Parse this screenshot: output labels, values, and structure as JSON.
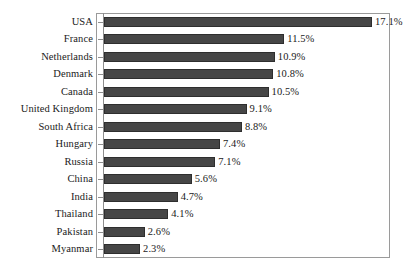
{
  "chart_data": {
    "type": "bar",
    "orientation": "horizontal",
    "title": "",
    "subtitle": "",
    "xlabel": "",
    "ylabel": "",
    "xlim": [
      0,
      17.1
    ],
    "grid": false,
    "legend": null,
    "value_suffix": "%",
    "categories": [
      "USA",
      "France",
      "Netherlands",
      "Denmark",
      "Canada",
      "United Kingdom",
      "South Africa",
      "Hungary",
      "Russia",
      "China",
      "India",
      "Thailand",
      "Pakistan",
      "Myanmar"
    ],
    "values": [
      17.1,
      11.5,
      10.9,
      10.8,
      10.5,
      9.1,
      8.8,
      7.4,
      7.1,
      5.6,
      4.7,
      4.1,
      2.6,
      2.3
    ],
    "value_labels": [
      "17.1%",
      "11.5%",
      "10.9%",
      "10.8%",
      "10.5%",
      "9.1%",
      "8.8%",
      "7.4%",
      "7.1%",
      "5.6%",
      "4.7%",
      "4.1%",
      "2.6%",
      "2.3%"
    ],
    "colors": {
      "bar_fill": "#464646",
      "bar_stroke": "#2e2e2e",
      "frame": "#9a9a9a",
      "axis": "#8e8e8e",
      "text": "#1a1a1a",
      "background": "#ffffff"
    }
  }
}
